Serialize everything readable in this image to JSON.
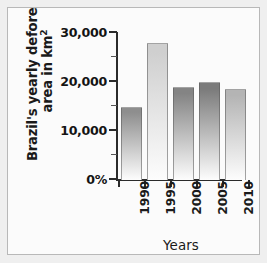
{
  "chart_data": {
    "type": "bar",
    "title": "",
    "ylabel_line1": "Brazil's yearly deforested",
    "ylabel_line2": "area in km",
    "ylabel_superscript": "2",
    "xlabel": "Years",
    "categories": [
      "1990",
      "1995",
      "2000",
      "2005",
      "2010"
    ],
    "values": [
      15000,
      28000,
      19000,
      20000,
      18500
    ],
    "ylim": [
      0,
      30000
    ],
    "ytick_labels": [
      "0%",
      "10,000",
      "20,000",
      "30,000"
    ],
    "ytick_values": [
      0,
      10000,
      20000,
      30000
    ],
    "yminor_values": [
      5000,
      15000,
      25000
    ],
    "grid": false,
    "legend": "none",
    "bar_colors": [
      "#8e8e8e",
      "#cfcfcf",
      "#848484",
      "#7b7b7b",
      "#b4b4b4"
    ]
  }
}
